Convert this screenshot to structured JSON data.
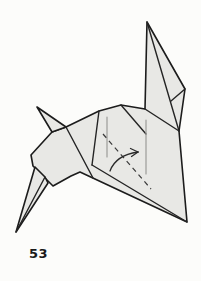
{
  "figure": {
    "step_number": "53"
  },
  "canvas": {
    "width": 201,
    "height": 281,
    "viewbox": "0 0 201 281"
  },
  "drawing": {
    "colors": {
      "paper": "#e8e8e5",
      "outline": "#1c1c1c",
      "internal_line": "#242424",
      "crease_gray": "#9b9b98",
      "fold_dash": "#3a3a3a",
      "arrow": "#2a2a2a",
      "background": "#fcfcfa"
    },
    "polygons": [
      {
        "name": "body-and-ear",
        "points": [
          [
            66,
            127
          ],
          [
            99,
            111
          ],
          [
            121,
            105
          ],
          [
            145,
            109
          ],
          [
            147,
            22
          ],
          [
            185,
            89
          ],
          [
            179,
            131
          ],
          [
            187,
            222
          ],
          [
            80,
            172
          ],
          [
            71,
            176
          ],
          [
            53,
            186
          ],
          [
            33,
            166
          ],
          [
            31,
            155
          ],
          [
            52,
            132
          ]
        ]
      },
      {
        "name": "left-ear-spike",
        "points": [
          [
            37,
            107
          ],
          [
            66,
            127
          ],
          [
            52,
            132
          ]
        ]
      },
      {
        "name": "front-leg",
        "points": [
          [
            16,
            232
          ],
          [
            35,
            167
          ],
          [
            45,
            177
          ],
          [
            48,
            183
          ]
        ]
      }
    ],
    "lines": [
      {
        "name": "ear-base-edge",
        "x1": 145,
        "y1": 109,
        "x2": 179,
        "y2": 131
      },
      {
        "name": "ear-long-crease",
        "x1": 147,
        "y1": 22,
        "x2": 179,
        "y2": 131
      },
      {
        "name": "ear-small-crease",
        "x1": 171,
        "y1": 101,
        "x2": 185,
        "y2": 89
      },
      {
        "name": "flap-top-diagonal",
        "x1": 121,
        "y1": 105,
        "x2": 146,
        "y2": 134
      },
      {
        "name": "flap-left-edge",
        "x1": 99,
        "y1": 111,
        "x2": 92,
        "y2": 165
      },
      {
        "name": "flap-bottom-edge",
        "x1": 92,
        "y1": 165,
        "x2": 187,
        "y2": 222
      },
      {
        "name": "chest-line",
        "x1": 66,
        "y1": 127,
        "x2": 93,
        "y2": 178
      },
      {
        "name": "leg-inner-line",
        "x1": 45,
        "y1": 177,
        "x2": 16,
        "y2": 232
      }
    ],
    "creases": [
      {
        "name": "vertical-crease-left",
        "x1": 107,
        "y1": 117,
        "x2": 107,
        "y2": 157
      },
      {
        "name": "vertical-crease-right",
        "x1": 146,
        "y1": 120,
        "x2": 146,
        "y2": 174
      }
    ],
    "fold_dashed_line": {
      "x1": 103,
      "y1": 134,
      "x2": 151,
      "y2": 189,
      "dash": "5 4"
    },
    "fold_arrow": {
      "path": "M 110 171 C 114 160, 124 154, 138 152",
      "head_tip": [
        138,
        152
      ],
      "head_barbs": [
        [
          130.5,
          148.5
        ],
        [
          131.5,
          156.5
        ]
      ]
    }
  }
}
